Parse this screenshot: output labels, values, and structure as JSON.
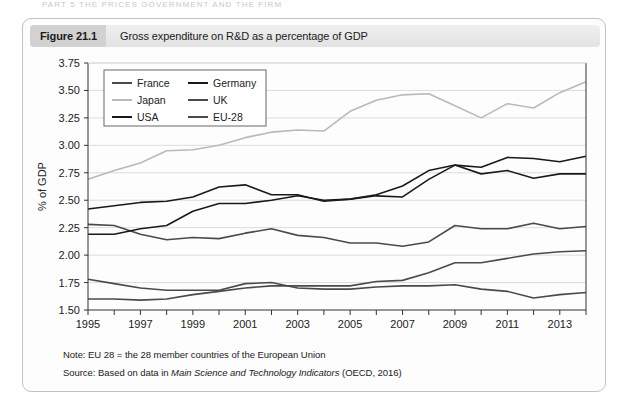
{
  "running_head": "PART 5  THE PRICES GOVERNMENT AND THE FIRM",
  "figure": {
    "number_label": "Figure 21.1",
    "caption": "Gross expenditure on R&D as a percentage of GDP"
  },
  "notes": {
    "note_prefix": "Note:",
    "note_text": "EU 28 = the 28 member countries of the European Union",
    "source_prefix": "Source:",
    "source_text_before": "Based on data in",
    "source_italic": "Main Science and Technology Indicators",
    "source_text_after": "(OECD, 2016)"
  },
  "colors": {
    "france": "#4a4a4a",
    "germany": "#1a1a1a",
    "japan": "#b9b9b9",
    "uk": "#4a4a4a",
    "usa": "#1a1a1a",
    "eu28": "#4a4a4a",
    "gridline": "#d8d8d8",
    "axis": "#333333"
  },
  "chart_data": {
    "type": "line",
    "title": "Gross expenditure on R&D as a percentage of GDP",
    "xlabel": "",
    "ylabel": "% of GDP",
    "ylim": [
      1.5,
      3.75
    ],
    "ytick_step": 0.25,
    "ytick_labels": [
      "1.50",
      "1.75",
      "2.00",
      "2.25",
      "2.50",
      "2.75",
      "3.00",
      "3.25",
      "3.50",
      "3.75"
    ],
    "xlim": [
      1995,
      2014
    ],
    "xtick_labels": [
      "1995",
      "1997",
      "1999",
      "2001",
      "2003",
      "2005",
      "2007",
      "2009",
      "2011",
      "2013"
    ],
    "xtick_values": [
      1995,
      1997,
      1999,
      2001,
      2003,
      2005,
      2007,
      2009,
      2011,
      2013
    ],
    "minor_xticks": [
      1996,
      1998,
      2000,
      2002,
      2004,
      2006,
      2008,
      2010,
      2012,
      2014
    ],
    "grid": "horizontal",
    "legend_position": "top-left-inside",
    "x": [
      1995,
      1996,
      1997,
      1998,
      1999,
      2000,
      2001,
      2002,
      2003,
      2004,
      2005,
      2006,
      2007,
      2008,
      2009,
      2010,
      2011,
      2012,
      2013,
      2014
    ],
    "series": [
      {
        "name": "France",
        "color": "#4a4a4a",
        "values": [
          2.28,
          2.27,
          2.19,
          2.14,
          2.16,
          2.15,
          2.2,
          2.24,
          2.18,
          2.16,
          2.11,
          2.11,
          2.08,
          2.12,
          2.27,
          2.24,
          2.24,
          2.29,
          2.24,
          2.26
        ]
      },
      {
        "name": "Germany",
        "color": "#1a1a1a",
        "values": [
          2.19,
          2.19,
          2.24,
          2.27,
          2.4,
          2.47,
          2.47,
          2.5,
          2.54,
          2.5,
          2.51,
          2.54,
          2.53,
          2.69,
          2.82,
          2.8,
          2.89,
          2.88,
          2.85,
          2.9
        ]
      },
      {
        "name": "Japan",
        "color": "#b9b9b9",
        "values": [
          2.69,
          2.77,
          2.84,
          2.95,
          2.96,
          3.0,
          3.07,
          3.12,
          3.14,
          3.13,
          3.31,
          3.41,
          3.46,
          3.47,
          3.36,
          3.25,
          3.38,
          3.34,
          3.48,
          3.58
        ]
      },
      {
        "name": "UK",
        "color": "#4a4a4a",
        "values": [
          1.78,
          1.74,
          1.7,
          1.68,
          1.68,
          1.68,
          1.74,
          1.75,
          1.7,
          1.69,
          1.69,
          1.71,
          1.72,
          1.72,
          1.73,
          1.69,
          1.67,
          1.61,
          1.64,
          1.66
        ]
      },
      {
        "name": "USA",
        "color": "#1a1a1a",
        "values": [
          2.42,
          2.45,
          2.48,
          2.49,
          2.53,
          2.62,
          2.64,
          2.55,
          2.55,
          2.49,
          2.51,
          2.55,
          2.63,
          2.77,
          2.82,
          2.74,
          2.77,
          2.7,
          2.74,
          2.74
        ]
      },
      {
        "name": "EU-28",
        "color": "#4a4a4a",
        "values": [
          1.6,
          1.6,
          1.59,
          1.6,
          1.64,
          1.67,
          1.7,
          1.72,
          1.72,
          1.72,
          1.72,
          1.76,
          1.77,
          1.84,
          1.93,
          1.93,
          1.97,
          2.01,
          2.03,
          2.04
        ]
      }
    ],
    "legend_entries": [
      {
        "label": "France",
        "color": "#4a4a4a"
      },
      {
        "label": "Germany",
        "color": "#1a1a1a"
      },
      {
        "label": "Japan",
        "color": "#b9b9b9"
      },
      {
        "label": "UK",
        "color": "#4a4a4a"
      },
      {
        "label": "USA",
        "color": "#1a1a1a"
      },
      {
        "label": "EU-28",
        "color": "#4a4a4a"
      }
    ]
  }
}
